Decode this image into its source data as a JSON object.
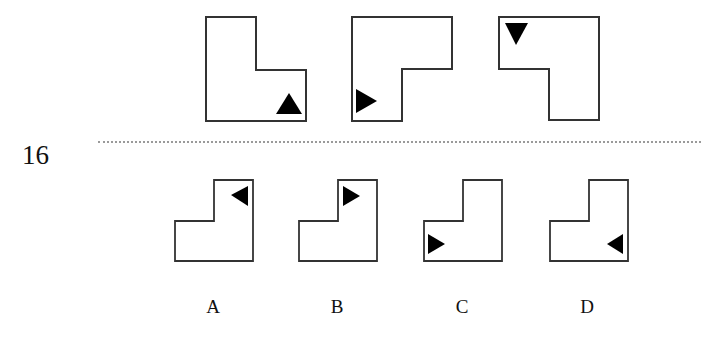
{
  "question": {
    "number": "16",
    "stem_figures": [
      {
        "id": "stem-1",
        "shape": "L-notch-top-right",
        "marker": "triangle-up",
        "marker_position": "bottom-right"
      },
      {
        "id": "stem-2",
        "shape": "L-notch-bottom-right",
        "marker": "triangle-right",
        "marker_position": "bottom-left"
      },
      {
        "id": "stem-3",
        "shape": "L-notch-bottom-left",
        "marker": "triangle-down",
        "marker_position": "top-left"
      }
    ],
    "options": [
      {
        "label": "A",
        "shape": "L-notch-top-left",
        "marker": "triangle-left",
        "marker_position": "top-right"
      },
      {
        "label": "B",
        "shape": "L-notch-top-left",
        "marker": "triangle-right",
        "marker_position": "top-right"
      },
      {
        "label": "C",
        "shape": "L-notch-top-left",
        "marker": "triangle-right",
        "marker_position": "bottom-left"
      },
      {
        "label": "D",
        "shape": "L-notch-top-left",
        "marker": "triangle-left",
        "marker_position": "bottom-right"
      }
    ]
  }
}
